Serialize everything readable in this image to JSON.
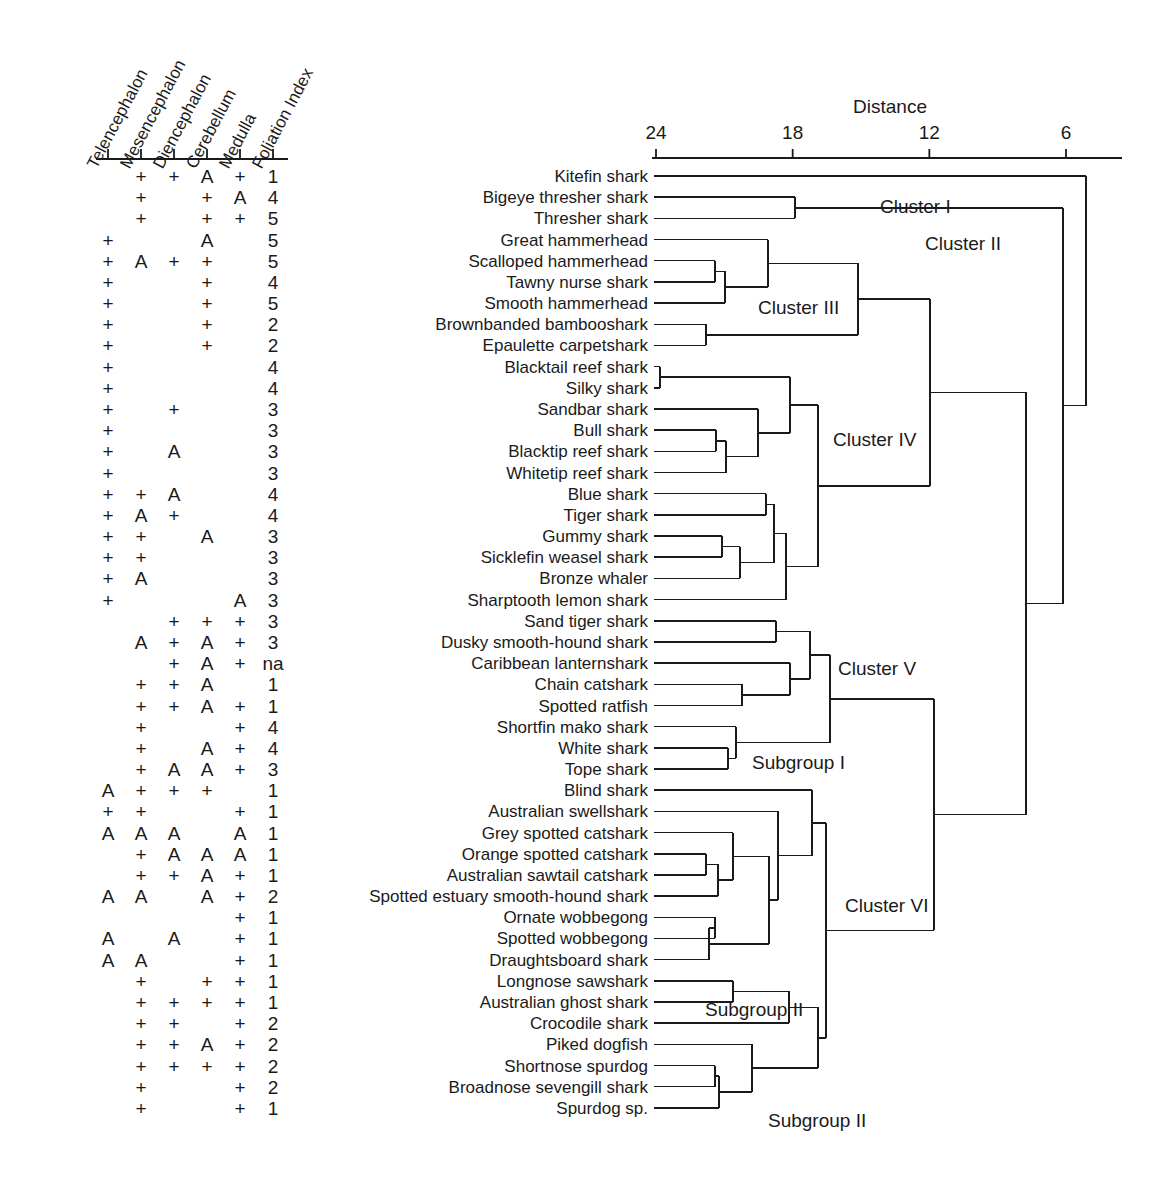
{
  "figure": {
    "type": "dendrogram-with-character-matrix",
    "n_taxa": 50
  },
  "matrix": {
    "columns": [
      {
        "name": "Telencephalon",
        "label": "Telencephalon"
      },
      {
        "name": "Mesencephalon",
        "label": "Mesencephalon"
      },
      {
        "name": "Diencephalon",
        "label": "Diencephalon"
      },
      {
        "name": "Cerebellum",
        "label": "Cerebellum"
      },
      {
        "name": "Medulla",
        "label": "Medulla"
      },
      {
        "name": "Foliation Index",
        "label": "Foliation Index"
      }
    ],
    "rows": [
      {
        "taxon": "Kitefin shark",
        "cells": [
          "",
          "+",
          "+",
          "A",
          "+",
          "1"
        ]
      },
      {
        "taxon": "Bigeye thresher shark",
        "cells": [
          "",
          "+",
          "",
          "+",
          "A",
          "4"
        ]
      },
      {
        "taxon": "Thresher shark",
        "cells": [
          "",
          "+",
          "",
          "+",
          "+",
          "5"
        ]
      },
      {
        "taxon": "Great hammerhead",
        "cells": [
          "+",
          "",
          "",
          "A",
          "",
          "5"
        ]
      },
      {
        "taxon": "Scalloped hammerhead",
        "cells": [
          "+",
          "A",
          "+",
          "+",
          "",
          "5"
        ]
      },
      {
        "taxon": "Tawny nurse shark",
        "cells": [
          "+",
          "",
          "",
          "+",
          "",
          "4"
        ]
      },
      {
        "taxon": "Smooth hammerhead",
        "cells": [
          "+",
          "",
          "",
          "+",
          "",
          "5"
        ]
      },
      {
        "taxon": "Brownbanded bambooshark",
        "cells": [
          "+",
          "",
          "",
          "+",
          "",
          "2"
        ]
      },
      {
        "taxon": "Epaulette carpetshark",
        "cells": [
          "+",
          "",
          "",
          "+",
          "",
          "2"
        ]
      },
      {
        "taxon": "Blacktail reef shark",
        "cells": [
          "+",
          "",
          "",
          "",
          "",
          "4"
        ]
      },
      {
        "taxon": "Silky shark",
        "cells": [
          "+",
          "",
          "",
          "",
          "",
          "4"
        ]
      },
      {
        "taxon": "Sandbar shark",
        "cells": [
          "+",
          "",
          "+",
          "",
          "",
          "3"
        ]
      },
      {
        "taxon": "Bull shark",
        "cells": [
          "+",
          "",
          "",
          "",
          "",
          "3"
        ]
      },
      {
        "taxon": "Blacktip reef shark",
        "cells": [
          "+",
          "",
          "A",
          "",
          "",
          "3"
        ]
      },
      {
        "taxon": "Whitetip reef shark",
        "cells": [
          "+",
          "",
          "",
          "",
          "",
          "3"
        ]
      },
      {
        "taxon": "Blue shark",
        "cells": [
          "+",
          "+",
          "A",
          "",
          "",
          "4"
        ]
      },
      {
        "taxon": "Tiger shark",
        "cells": [
          "+",
          "A",
          "+",
          "",
          "",
          "4"
        ]
      },
      {
        "taxon": "Gummy shark",
        "cells": [
          "+",
          "+",
          "",
          "A",
          "",
          "3"
        ]
      },
      {
        "taxon": "Sicklefin weasel shark",
        "cells": [
          "+",
          "+",
          "",
          "",
          "",
          "3"
        ]
      },
      {
        "taxon": "Bronze whaler",
        "cells": [
          "+",
          "A",
          "",
          "",
          "",
          "3"
        ]
      },
      {
        "taxon": "Sharptooth lemon shark",
        "cells": [
          "+",
          "",
          "",
          "",
          "A",
          "3"
        ]
      },
      {
        "taxon": "Sand tiger shark",
        "cells": [
          "",
          "",
          "+",
          "+",
          "+",
          "3"
        ]
      },
      {
        "taxon": "Dusky smooth-hound shark",
        "cells": [
          "",
          "A",
          "+",
          "A",
          "+",
          "3"
        ]
      },
      {
        "taxon": "Caribbean lanternshark",
        "cells": [
          "",
          "",
          "+",
          "A",
          "+",
          "na"
        ]
      },
      {
        "taxon": "Chain catshark",
        "cells": [
          "",
          "+",
          "+",
          "A",
          "",
          "1"
        ]
      },
      {
        "taxon": "Spotted ratfish",
        "cells": [
          "",
          "+",
          "+",
          "A",
          "+",
          "1"
        ]
      },
      {
        "taxon": "Shortfin mako shark",
        "cells": [
          "",
          "+",
          "",
          "",
          "+",
          "4"
        ]
      },
      {
        "taxon": "White shark",
        "cells": [
          "",
          "+",
          "",
          "A",
          "+",
          "4"
        ]
      },
      {
        "taxon": "Tope shark",
        "cells": [
          "",
          "+",
          "A",
          "A",
          "+",
          "3"
        ]
      },
      {
        "taxon": "Blind shark",
        "cells": [
          "A",
          "+",
          "+",
          "+",
          "",
          "1"
        ]
      },
      {
        "taxon": "Australian swellshark",
        "cells": [
          "+",
          "+",
          "",
          "",
          "+",
          "1"
        ]
      },
      {
        "taxon": "Grey spotted catshark",
        "cells": [
          "A",
          "A",
          "A",
          "",
          "A",
          "1"
        ]
      },
      {
        "taxon": "Orange spotted catshark",
        "cells": [
          "",
          "+",
          "A",
          "A",
          "A",
          "1"
        ]
      },
      {
        "taxon": "Australian sawtail catshark",
        "cells": [
          "",
          "+",
          "+",
          "A",
          "+",
          "1"
        ]
      },
      {
        "taxon": "Spotted estuary smooth-hound shark",
        "cells": [
          "A",
          "A",
          "",
          "A",
          "+",
          "2"
        ]
      },
      {
        "taxon": "Ornate wobbegong",
        "cells": [
          "",
          "",
          "",
          "",
          "+",
          "1"
        ]
      },
      {
        "taxon": "Spotted wobbegong",
        "cells": [
          "A",
          "",
          "A",
          "",
          "+",
          "1"
        ]
      },
      {
        "taxon": "Draughtsboard shark",
        "cells": [
          "A",
          "A",
          "",
          "",
          "+",
          "1"
        ]
      },
      {
        "taxon": "Longnose sawshark",
        "cells": [
          "",
          "+",
          "",
          "+",
          "+",
          "1"
        ]
      },
      {
        "taxon": "Australian ghost shark",
        "cells": [
          "",
          "+",
          "+",
          "+",
          "+",
          "1"
        ]
      },
      {
        "taxon": "Crocodile shark",
        "cells": [
          "",
          "+",
          "+",
          "",
          "+",
          "2"
        ]
      },
      {
        "taxon": "Piked dogfish",
        "cells": [
          "",
          "+",
          "+",
          "A",
          "+",
          "2"
        ]
      },
      {
        "taxon": "Shortnose spurdog",
        "cells": [
          "",
          "+",
          "+",
          "+",
          "+",
          "2"
        ]
      },
      {
        "taxon": "Broadnose sevengill shark",
        "cells": [
          "",
          "+",
          "",
          "",
          "+",
          "2"
        ]
      },
      {
        "taxon": "Spurdog sp.",
        "cells": [
          "",
          "+",
          "",
          "",
          "+",
          "1"
        ]
      }
    ]
  },
  "chart_data": {
    "type": "dendrogram",
    "title": "",
    "xlabel": "Distance",
    "axis": {
      "label": "Distance",
      "ticks": [
        24,
        18,
        12,
        6
      ],
      "range_left": 24,
      "range_right": 2,
      "direction": "reversed"
    },
    "leaves": [
      "Kitefin shark",
      "Bigeye thresher shark",
      "Thresher shark",
      "Great hammerhead",
      "Scalloped hammerhead",
      "Tawny nurse shark",
      "Smooth hammerhead",
      "Brownbanded bambooshark",
      "Epaulette carpetshark",
      "Blacktail reef shark",
      "Silky shark",
      "Sandbar shark",
      "Bull shark",
      "Blacktip reef shark",
      "Whitetip reef shark",
      "Blue shark",
      "Tiger shark",
      "Gummy shark",
      "Sicklefin weasel shark",
      "Bronze whaler",
      "Sharptooth lemon shark",
      "Sand tiger shark",
      "Dusky smooth-hound shark",
      "Caribbean lanternshark",
      "Chain catshark",
      "Spotted ratfish",
      "Shortfin mako shark",
      "White shark",
      "Tope shark",
      "Blind shark",
      "Australian swellshark",
      "Grey spotted catshark",
      "Orange spotted catshark",
      "Australian sawtail catshark",
      "Spotted estuary smooth-hound shark",
      "Ornate wobbegong",
      "Spotted wobbegong",
      "Draughtsboard shark",
      "Longnose sawshark",
      "Australian ghost shark",
      "Crocodile shark",
      "Piked dogfish",
      "Shortnose spurdog",
      "Broadnose sevengill shark",
      "Spurdog sp."
    ],
    "cluster_labels": [
      {
        "text": "Cluster I",
        "x": 880,
        "y": 196
      },
      {
        "text": "Cluster II",
        "x": 925,
        "y": 233
      },
      {
        "text": "Cluster III",
        "x": 758,
        "y": 297
      },
      {
        "text": "Cluster IV",
        "x": 833,
        "y": 429
      },
      {
        "text": "Cluster V",
        "x": 838,
        "y": 658
      },
      {
        "text": "Subgroup I",
        "x": 752,
        "y": 752
      },
      {
        "text": "Cluster VI",
        "x": 845,
        "y": 895
      },
      {
        "text": "Subgroup II",
        "x": 705,
        "y": 999
      },
      {
        "text": "Subgroup II",
        "x": 768,
        "y": 1110
      }
    ]
  },
  "style": {
    "line_color": "#1a1a1a",
    "background": "#ffffff"
  }
}
